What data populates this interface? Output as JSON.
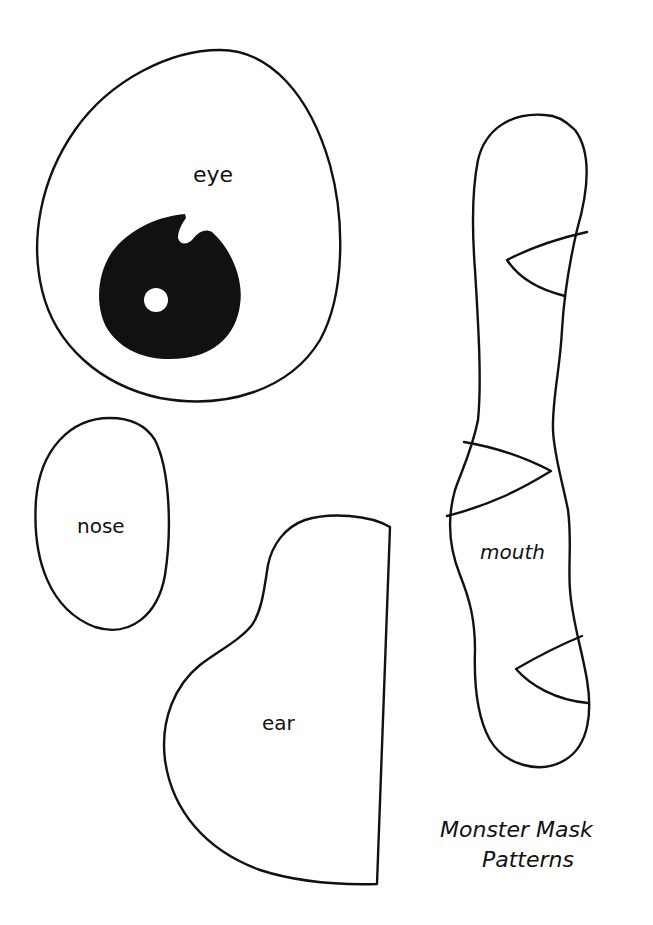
{
  "patterns": {
    "eye": {
      "label": "eye"
    },
    "nose": {
      "label": "nose"
    },
    "ear": {
      "label": "ear"
    },
    "mouth": {
      "label": "mouth"
    }
  },
  "title": {
    "line1": "Monster Mask",
    "line2": "Patterns"
  },
  "colors": {
    "background": "#ffffff",
    "ink": "#111111"
  }
}
